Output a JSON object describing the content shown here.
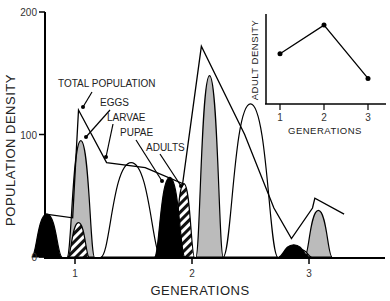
{
  "chart_data": [
    {
      "type": "area",
      "title": "",
      "xlabel": "GENERATIONS",
      "ylabel": "POPULATION DENSITY",
      "ylim": [
        0,
        200
      ],
      "xlim": [
        0.75,
        3.65
      ],
      "yticks": [
        0,
        100,
        200
      ],
      "xticks": [
        1,
        2,
        3
      ],
      "grid": false,
      "series": [
        {
          "name": "TOTAL POPULATION",
          "style": "line",
          "points": [
            [
              0.75,
              35
            ],
            [
              0.98,
              32
            ],
            [
              1.03,
              120
            ],
            [
              1.27,
              77
            ],
            [
              1.6,
              73
            ],
            [
              1.92,
              60
            ],
            [
              2.08,
              172
            ],
            [
              2.45,
              100
            ],
            [
              2.7,
              40
            ],
            [
              2.85,
              15
            ],
            [
              3.03,
              40
            ],
            [
              3.05,
              48
            ],
            [
              3.3,
              35
            ]
          ]
        },
        {
          "name": "EGGS",
          "style": "gray",
          "peaks": [
            {
              "center": 1.05,
              "height": 95
            },
            {
              "center": 2.15,
              "height": 148
            },
            {
              "center": 3.08,
              "height": 38
            }
          ]
        },
        {
          "name": "LARVAE",
          "style": "white",
          "peaks": [
            {
              "center": 1.48,
              "height": 77
            },
            {
              "center": 2.5,
              "height": 125
            }
          ]
        },
        {
          "name": "PUPAE",
          "style": "hatched",
          "peaks": [
            {
              "center": 1.03,
              "height": 28
            },
            {
              "center": 1.93,
              "height": 60
            },
            {
              "center": 2.93,
              "height": 6
            }
          ]
        },
        {
          "name": "ADULTS",
          "style": "black",
          "peaks": [
            {
              "center": 0.76,
              "height": 35
            },
            {
              "center": 1.81,
              "height": 65
            },
            {
              "center": 2.87,
              "height": 10
            }
          ]
        }
      ],
      "annotations": [
        "TOTAL POPULATION",
        "EGGS",
        "LARVAE",
        "PUPAE",
        "ADULTS"
      ]
    },
    {
      "type": "line",
      "title": "",
      "xlabel": "GENERATIONS",
      "ylabel": "ADULT DENSITY",
      "categories": [
        "1",
        "2",
        "3"
      ],
      "values": [
        0.6,
        0.95,
        0.3
      ],
      "ylim": [
        0,
        1
      ],
      "grid": false
    }
  ]
}
